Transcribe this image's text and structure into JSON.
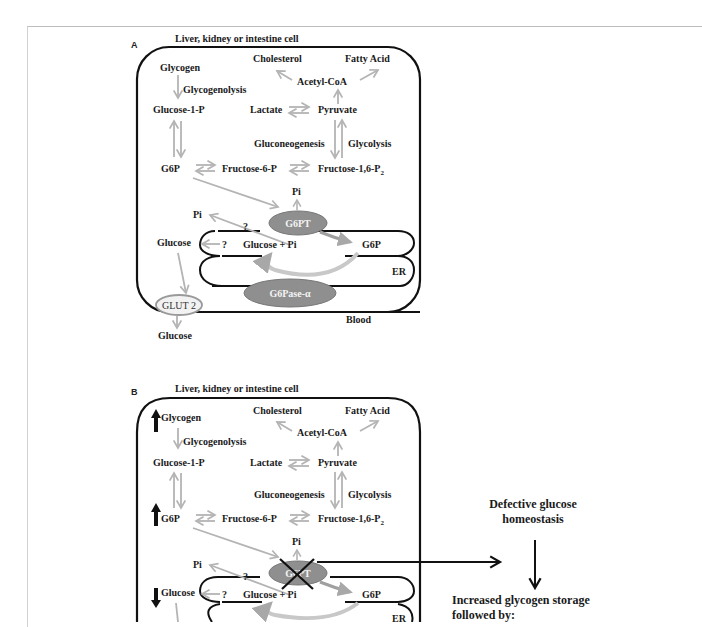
{
  "panels": [
    {
      "letter": "A",
      "cell_title": "Liver, kidney or intestine cell",
      "labels": {
        "glycogen": "Glycogen",
        "glycogenolysis": "Glycogenolysis",
        "glucose_1_p": "Glucose-1-P",
        "g6p": "G6P",
        "fructose_6_p": "Fructose-6-P",
        "fructose_16_p2": "Fructose-1,6-P",
        "fructose_sub": "2",
        "cholesterol": "Cholesterol",
        "fatty_acid": "Fatty Acid",
        "acetyl_coa": "Acetyl-CoA",
        "lactate": "Lactate",
        "pyruvate": "Pyruvate",
        "gluconeogenesis": "Gluconeogenesis",
        "glycolysis": "Glycolysis",
        "pi_top": "Pi",
        "pi_left": "Pi",
        "question_1": "?",
        "question_2": "?",
        "glucose_cyto": "Glucose",
        "glucose_pi": "Glucose + Pi",
        "g6p_er": "G6P",
        "er": "ER",
        "g6pt": "G6PT",
        "g6pase": "G6Pase-α",
        "glut2": "GLUT 2",
        "blood": "Blood",
        "glucose_blood": "Glucose"
      }
    },
    {
      "letter": "B",
      "cell_title": "Liver, kidney or intestine cell",
      "labels": {
        "glycogen": "Glycogen",
        "glycogenolysis": "Glycogenolysis",
        "glucose_1_p": "Glucose-1-P",
        "g6p": "G6P",
        "fructose_6_p": "Fructose-6-P",
        "fructose_16_p2": "Fructose-1,6-P",
        "fructose_sub": "2",
        "cholesterol": "Cholesterol",
        "fatty_acid": "Fatty Acid",
        "acetyl_coa": "Acetyl-CoA",
        "lactate": "Lactate",
        "pyruvate": "Pyruvate",
        "gluconeogenesis": "Gluconeogenesis",
        "glycolysis": "Glycolysis",
        "pi_top": "Pi",
        "pi_left": "Pi",
        "question_1": "?",
        "question_2": "?",
        "glucose_cyto": "Glucose",
        "glucose_pi": "Glucose + Pi",
        "g6p_er": "G6P",
        "er": "ER",
        "g6pt": "G6PT"
      },
      "indicators": {
        "glycogen": "up",
        "g6p": "up",
        "glucose": "down"
      },
      "consequences": {
        "defective_line1": "Defective glucose",
        "defective_line2": "homeostasis",
        "increased_line1": "Increased glycogen storage",
        "increased_line2": "followed by:"
      }
    }
  ],
  "colors": {
    "arrow_gray": "#b4b4b4",
    "enzyme_fill": "#8f8f8f",
    "membrane": "#111111",
    "glut_stroke": "#9a9a9a"
  }
}
